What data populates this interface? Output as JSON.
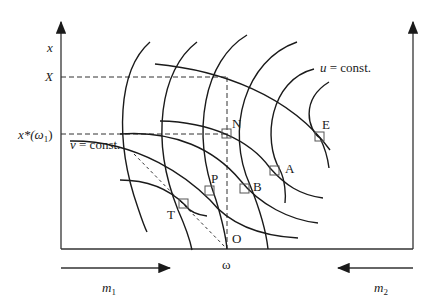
{
  "figure": {
    "axes": {
      "left_axis_label": "x",
      "right_axis_label": "",
      "bottom_label": "ω",
      "left_ticks": [
        {
          "label": "X",
          "y": 77
        },
        {
          "label": "x*(ω",
          "sub": "1",
          "close": ")",
          "y": 134
        }
      ]
    },
    "curve_labels": {
      "u": "u",
      "u_rest": " = const.",
      "v": "v",
      "v_rest": " = const."
    },
    "points": [
      {
        "id": "N",
        "label": "N"
      },
      {
        "id": "E",
        "label": "E"
      },
      {
        "id": "A",
        "label": "A"
      },
      {
        "id": "B",
        "label": "B"
      },
      {
        "id": "P",
        "label": "P"
      },
      {
        "id": "T",
        "label": "T"
      },
      {
        "id": "O",
        "label": "O"
      }
    ],
    "arrows": {
      "m1": {
        "label": "m",
        "sub": "1",
        "direction": "right"
      },
      "m2": {
        "label": "m",
        "sub": "2",
        "direction": "left"
      }
    }
  }
}
